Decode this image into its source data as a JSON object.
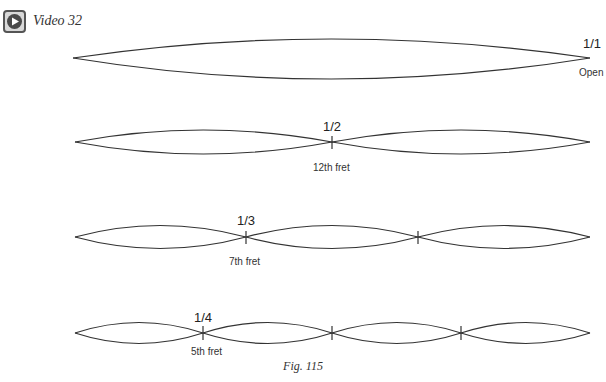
{
  "header": {
    "video_icon": "play-video-icon",
    "video_label": "Video 32"
  },
  "harmonics": [
    {
      "ratio": "1/1",
      "fret": "Open",
      "segments": 1
    },
    {
      "ratio": "1/2",
      "fret": "12th fret",
      "segments": 2
    },
    {
      "ratio": "1/3",
      "fret": "7th fret",
      "segments": 3
    },
    {
      "ratio": "1/4",
      "fret": "5th fret",
      "segments": 4
    }
  ],
  "caption": "Fig. 115",
  "colors": {
    "stroke": "#333333",
    "icon_frame": "#555555"
  }
}
